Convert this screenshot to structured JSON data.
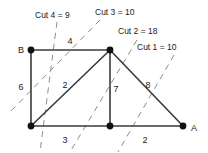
{
  "figure": {
    "kind": "graph-cut-diagram",
    "background_color": "#ffffff",
    "edge_color": "#3a3a3a",
    "node_color": "#111111",
    "cut_line_color": "#8c8c8c"
  },
  "nodes": [
    {
      "id": "B",
      "label": "B",
      "x": 31,
      "y": 50,
      "label_x": 21,
      "label_y": 53
    },
    {
      "id": "T",
      "label": "",
      "x": 110,
      "y": 50,
      "label_x": 110,
      "label_y": 50
    },
    {
      "id": "L",
      "label": "",
      "x": 31,
      "y": 126,
      "label_x": 31,
      "label_y": 126
    },
    {
      "id": "M",
      "label": "",
      "x": 110,
      "y": 126,
      "label_x": 110,
      "label_y": 126
    },
    {
      "id": "A",
      "label": "A",
      "x": 183,
      "y": 126,
      "label_x": 194,
      "label_y": 131
    }
  ],
  "edges": [
    {
      "from": "B",
      "to": "T",
      "weight": "4",
      "label_x": 70,
      "label_y": 44
    },
    {
      "from": "B",
      "to": "L",
      "weight": "6",
      "label_x": 21,
      "label_y": 90
    },
    {
      "from": "L",
      "to": "T",
      "weight": "2",
      "label_x": 65,
      "label_y": 88
    },
    {
      "from": "T",
      "to": "M",
      "weight": "7",
      "label_x": 116,
      "label_y": 92
    },
    {
      "from": "T",
      "to": "A",
      "weight": "8",
      "label_x": 148,
      "label_y": 88
    },
    {
      "from": "L",
      "to": "M",
      "weight": "3",
      "label_x": 65,
      "label_y": 143
    },
    {
      "from": "M",
      "to": "A",
      "weight": "2",
      "label_x": 145,
      "label_y": 143
    }
  ],
  "cuts": [
    {
      "id": "cut4",
      "label": "Cut 4 = 9",
      "label_x": 35,
      "label_y": 18,
      "x1": 57,
      "y1": 22,
      "x2": 40,
      "y2": 152
    },
    {
      "id": "cut3",
      "label": "Cut 3 = 10",
      "label_x": 95,
      "label_y": 15,
      "x1": 100,
      "y1": 20,
      "x2": 8,
      "y2": 114
    },
    {
      "id": "cut2",
      "label": "Cut 2 = 18",
      "label_x": 118,
      "label_y": 34,
      "x1": 137,
      "y1": 40,
      "x2": 70,
      "y2": 152
    },
    {
      "id": "cut1",
      "label": "Cut 1 = 10",
      "label_x": 137,
      "label_y": 50,
      "x1": 174,
      "y1": 55,
      "x2": 118,
      "y2": 152
    }
  ]
}
